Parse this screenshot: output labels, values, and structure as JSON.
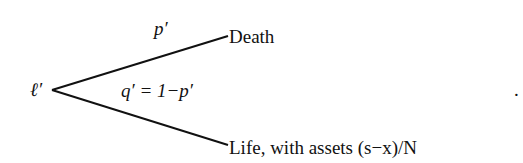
{
  "diagram": {
    "root": {
      "label": "ℓ′"
    },
    "branches": [
      {
        "name": "death",
        "probability": "p′",
        "outcome": "Death"
      },
      {
        "name": "life",
        "probability": "q′ = 1−p′",
        "outcome": "Life, with assets (s−x)/N"
      }
    ],
    "trailing_punctuation": "."
  }
}
